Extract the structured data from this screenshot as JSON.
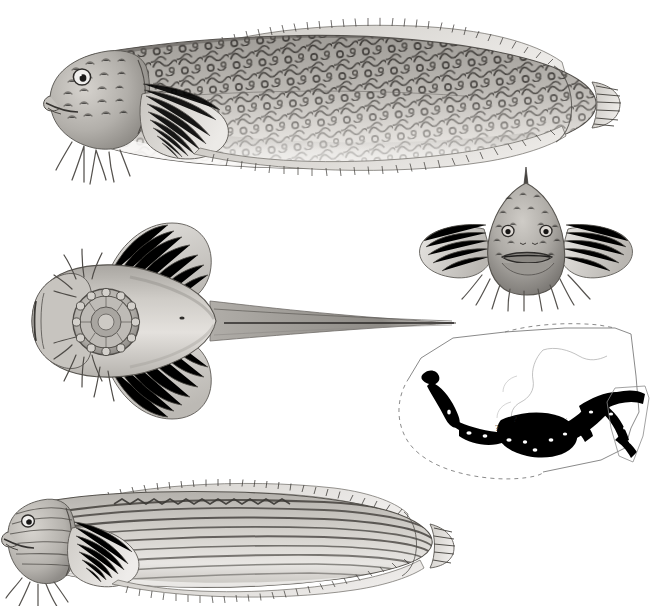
{
  "plate": {
    "title": "Scientific illustration plate — marine fish (snailfish / sculpin), four anatomical views with Alaska distribution map",
    "medium": "graphite / stipple scientific drawing, grayscale on white",
    "background_color": "#ffffff",
    "ink_color": "#3a3a3a",
    "width_px": 654,
    "height_px": 604,
    "visible_text": []
  },
  "panels": [
    {
      "id": "lateral-view-vermiculated",
      "name": "Lateral view, vermiculate-patterned specimen",
      "position": "top, spanning left to right",
      "orientation": "head to the left, tail to the right",
      "bbox": [
        20,
        10,
        620,
        185
      ],
      "features": [
        "large bulbous head with prominent round eye",
        "downturned terminal mouth with short barbel",
        "branched pelvic / chin cirri beneath the head",
        "broad rounded pectoral fin with radiating fin rays",
        "continuous dorsal fin running the full length of the body",
        "continuous anal fin along the ventral margin",
        "small rounded caudal fin",
        "dense vermiculate (worm-like) dark squiggle markings over the dorsal two thirds",
        "pale unmarked ventral surface"
      ],
      "tone": "mid-gray body with dark brown-black vermiculations"
    },
    {
      "id": "frontal-head-view",
      "name": "Frontal (anterior) head view",
      "position": "middle right",
      "bbox": [
        400,
        165,
        250,
        140
      ],
      "features": [
        "triangular head narrowing to a pointed dorsal spine at the apex",
        "two small widely spaced eyes",
        "wide transverse mouth with thick lips",
        "pectoral fins spread laterally like wings on both sides",
        "fringe of branched barbels along the lower jaw and chest",
        "granular stippled skin texture"
      ]
    },
    {
      "id": "ventral-view-sucking-disc",
      "name": "Ventral view showing pelvic sucking disc",
      "position": "middle left, spanning to center",
      "bbox": [
        15,
        210,
        440,
        220
      ],
      "features": [
        "flattened broad head seen from below",
        "circular pelvic sucking disc with radiating marginal lobes, centered behind the head",
        "paired pectoral fins fanning outward above and below",
        "fringe of branched cirri around the head margin",
        "body tapering to a long narrow pointed tail",
        "small ventral pore / vent visible mid-body"
      ]
    },
    {
      "id": "distribution-map",
      "name": "Alaska distribution map inset",
      "position": "lower right",
      "bbox": [
        395,
        320,
        255,
        175
      ],
      "map": {
        "region": "Alaska and the North Pacific",
        "land_outline": "thin gray line — Alaska mainland, Alaska Peninsula, Aleutian Islands and Southeast Alaska panhandle",
        "boundary_style": "dashed thin line marking the exclusive economic zone / study area limit",
        "range_shading": "solid black coastal band",
        "range_description": "solid black distribution band following the Aleutian Island chain eastward along the Alaska Peninsula, around the Gulf of Alaska, and down the Southeast Alaska panhandle",
        "uncertainty_markers": [
          "?",
          "?"
        ],
        "uncertainty_note": "two question marks over Bristol Bay / Bering Sea indicating uncertain range extent"
      }
    },
    {
      "id": "lateral-view-striped",
      "name": "Lateral view, longitudinally striped specimen (second species or variant)",
      "position": "bottom, spanning left to right",
      "bbox": [
        0,
        470,
        450,
        134
      ],
      "orientation": "head to the left, tail to the right",
      "features": [
        "blunt rounded head with round eye",
        "branched chin cirri and short barbels",
        "large rounded pectoral fin with dense rays",
        "strong longitudinal dark stripes running head to tail along the flanks",
        "zigzag / vermiculate band along the dorsal fin base",
        "continuous dorsal and anal fins with serrated ray margins",
        "narrow rounded caudal fin"
      ],
      "tone": "light gray body with parallel dark longitudinal striping"
    }
  ],
  "colors": {
    "paper": "#ffffff",
    "light_tone": "#d8d6d2",
    "mid_tone": "#a8a5a0",
    "dark_tone": "#6e6b66",
    "ink": "#2e2c2a",
    "map_line": "#8a8a8a",
    "map_range": "#000000"
  }
}
